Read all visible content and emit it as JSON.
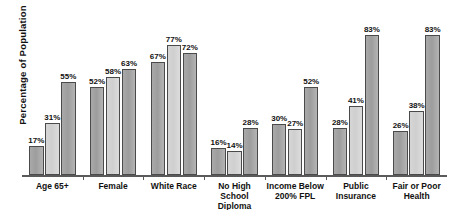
{
  "chart_data": {
    "type": "bar",
    "title": "",
    "xlabel": "",
    "ylabel": "Percentage of Population",
    "ylim": [
      0,
      100
    ],
    "grid": false,
    "legend": "none",
    "value_suffix": "%",
    "categories": [
      "Age 65+",
      "Female",
      "White Race",
      "No High School Diploma",
      "Income Below 200% FPL",
      "Public Insurance",
      "Fair or Poor Health"
    ],
    "category_lines": [
      [
        "Age 65+"
      ],
      [
        "Female"
      ],
      [
        "White Race"
      ],
      [
        "No High School",
        "Diploma"
      ],
      [
        "Income Below",
        "200% FPL"
      ],
      [
        "Public",
        "Insurance"
      ],
      [
        "Fair or Poor",
        "Health"
      ]
    ],
    "series": [
      {
        "name": "Series 1",
        "shade": "dark",
        "values": [
          17,
          52,
          67,
          16,
          30,
          28,
          26
        ]
      },
      {
        "name": "Series 2",
        "shade": "light",
        "values": [
          31,
          58,
          77,
          14,
          27,
          41,
          38
        ]
      },
      {
        "name": "Series 3",
        "shade": "dark",
        "values": [
          55,
          63,
          72,
          28,
          52,
          83,
          83
        ]
      }
    ],
    "data_labels": [
      [
        "17%",
        "31%",
        "55%"
      ],
      [
        "52%",
        "58%",
        "63%"
      ],
      [
        "67%",
        "77%",
        "72%"
      ],
      [
        "16%",
        "14%",
        "28%"
      ],
      [
        "30%",
        "27%",
        "52%"
      ],
      [
        "28%",
        "41%",
        "83%"
      ],
      [
        "26%",
        "38%",
        "83%"
      ]
    ],
    "colors": {
      "dark_bar": "#a9a9a9",
      "light_bar": "#d6d6d6",
      "bar_outline": "#4a4a4a",
      "axis": "#5a5a5a",
      "text": "#111111",
      "background": "#ffffff"
    }
  }
}
